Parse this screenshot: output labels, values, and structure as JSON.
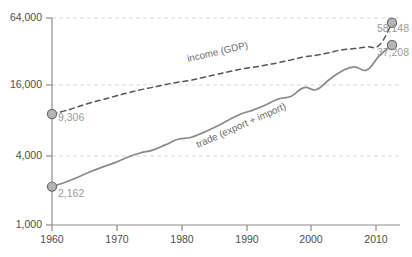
{
  "chart_data": {
    "type": "line",
    "title": "",
    "subtitle": "",
    "xlabel": "",
    "ylabel": "",
    "yscale": "log",
    "ylim": [
      1000,
      64000
    ],
    "xlim": [
      1960,
      2014
    ],
    "grid": true,
    "legend_position": "inline-annotation",
    "y_ticks": [
      {
        "value": 1000,
        "label": "1,000"
      },
      {
        "value": 4000,
        "label": "4,000"
      },
      {
        "value": 16000,
        "label": "16,000"
      },
      {
        "value": 64000,
        "label": "64,000"
      }
    ],
    "x_ticks": [
      {
        "value": 1960,
        "label": "1960"
      },
      {
        "value": 1970,
        "label": "1970"
      },
      {
        "value": 1980,
        "label": "1980"
      },
      {
        "value": 1990,
        "label": "1990"
      },
      {
        "value": 2000,
        "label": "2000"
      },
      {
        "value": 2010,
        "label": "2010"
      }
    ],
    "series": [
      {
        "name": "income (GDP)",
        "annotation": "income (GDP)",
        "style": "dashed",
        "color": "#555555",
        "start_label": "9,306",
        "end_label": "58,148",
        "start_value": 9306,
        "end_value": 58148,
        "x": [
          1960,
          1962,
          1964,
          1966,
          1968,
          1970,
          1972,
          1974,
          1976,
          1978,
          1980,
          1982,
          1984,
          1986,
          1988,
          1990,
          1992,
          1994,
          1996,
          1998,
          2000,
          2002,
          2004,
          2006,
          2008,
          2010,
          2012,
          2014
        ],
        "values": [
          9306,
          9900,
          10700,
          11600,
          12400,
          13300,
          14200,
          15100,
          15900,
          16800,
          17600,
          18300,
          19400,
          20500,
          21700,
          22900,
          23800,
          24900,
          26100,
          27600,
          29200,
          30300,
          31900,
          33700,
          34600,
          35800,
          37200,
          58148
        ]
      },
      {
        "name": "trade (export + import)",
        "annotation": "trade (export + import)",
        "style": "solid",
        "color": "#8a8a8a",
        "start_label": "2,162",
        "end_label": "37,208",
        "start_value": 2162,
        "end_value": 37208,
        "x": [
          1960,
          1962,
          1964,
          1966,
          1968,
          1970,
          1972,
          1974,
          1976,
          1978,
          1980,
          1982,
          1984,
          1986,
          1988,
          1990,
          1992,
          1994,
          1996,
          1998,
          2000,
          2002,
          2004,
          2006,
          2008,
          2010,
          2012,
          2014
        ],
        "values": [
          2162,
          2350,
          2600,
          2900,
          3200,
          3500,
          3900,
          4250,
          4500,
          5000,
          5600,
          5800,
          6400,
          7200,
          8200,
          9300,
          10100,
          11200,
          12600,
          13300,
          15800,
          15200,
          18500,
          22000,
          24000,
          22500,
          30000,
          37208
        ]
      }
    ]
  },
  "labels": {
    "income_annotation": "income (GDP)",
    "trade_annotation": "trade (export + import)",
    "income_start": "9,306",
    "income_end": "58,148",
    "trade_start": "2,162",
    "trade_end": "37,208",
    "y_64000": "64,000",
    "y_16000": "16,000",
    "y_4000": "4,000",
    "y_1000": "1,000",
    "x_1960": "1960",
    "x_1970": "1970",
    "x_1980": "1980",
    "x_1990": "1990",
    "x_2000": "2000",
    "x_2010": "2010"
  },
  "colors": {
    "income_line": "#555555",
    "trade_line": "#8a8a8a",
    "marker_fill": "#b5b5b5",
    "marker_stroke": "#6e6e6e",
    "grid": "#d9d9d9",
    "axis": "#8c8c8c",
    "tick_text": "#4d4d4d",
    "endpoint_text": "#9a9a9a",
    "background": "#ffffff"
  }
}
